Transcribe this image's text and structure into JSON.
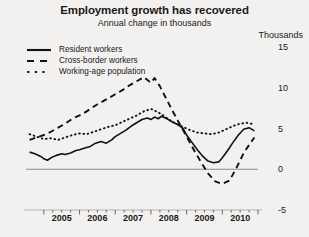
{
  "chart_data": {
    "type": "line",
    "title": "Employment growth has recovered",
    "subtitle": "Annual change in thousands",
    "unit_label": "Thousands",
    "xlabel": "",
    "ylabel": "Thousands",
    "ylim": [
      -5,
      15
    ],
    "yticks": [
      15,
      10,
      5,
      0,
      -5
    ],
    "ytick_labels": [
      "15",
      "10",
      "5",
      "0",
      "-5"
    ],
    "xlim": [
      2004.5,
      2011.0
    ],
    "xticks": [
      2005,
      2006,
      2007,
      2008,
      2009,
      2010
    ],
    "xtick_labels": [
      "2005",
      "2006",
      "2007",
      "2008",
      "2009",
      "2010"
    ],
    "minor_ticks_per_year": 4,
    "grid": false,
    "zero_line": true,
    "legend_position": "top-left",
    "series": [
      {
        "name": "Resident workers",
        "style": "solid",
        "color": "#111111",
        "x": [
          2004.6,
          2004.75,
          2004.9,
          2005.0,
          2005.1,
          2005.2,
          2005.35,
          2005.5,
          2005.6,
          2005.75,
          2005.9,
          2006.0,
          2006.15,
          2006.3,
          2006.45,
          2006.6,
          2006.75,
          2006.9,
          2007.0,
          2007.15,
          2007.3,
          2007.45,
          2007.6,
          2007.75,
          2007.9,
          2008.0,
          2008.1,
          2008.2,
          2008.3,
          2008.45,
          2008.6,
          2008.75,
          2008.9,
          2009.0,
          2009.15,
          2009.3,
          2009.45,
          2009.6,
          2009.75,
          2009.9,
          2010.0,
          2010.15,
          2010.3,
          2010.45,
          2010.6,
          2010.75,
          2010.9
        ],
        "y": [
          2.1,
          1.9,
          1.6,
          1.3,
          1.1,
          1.4,
          1.7,
          1.9,
          1.8,
          2.0,
          2.3,
          2.4,
          2.6,
          2.8,
          3.2,
          3.4,
          3.2,
          3.6,
          4.0,
          4.4,
          4.8,
          5.3,
          5.7,
          6.1,
          6.3,
          6.1,
          6.4,
          6.2,
          6.5,
          6.2,
          5.8,
          5.5,
          5.0,
          4.2,
          3.3,
          2.4,
          1.6,
          1.0,
          0.8,
          0.9,
          1.4,
          2.3,
          3.3,
          4.2,
          4.9,
          5.1,
          4.7
        ]
      },
      {
        "name": "Cross-border workers",
        "style": "dashed",
        "color": "#111111",
        "x": [
          2004.6,
          2004.8,
          2005.0,
          2005.2,
          2005.4,
          2005.6,
          2005.8,
          2006.0,
          2006.2,
          2006.4,
          2006.6,
          2006.8,
          2007.0,
          2007.2,
          2007.4,
          2007.6,
          2007.8,
          2008.0,
          2008.1,
          2008.25,
          2008.4,
          2008.6,
          2008.8,
          2009.0,
          2009.2,
          2009.4,
          2009.6,
          2009.8,
          2010.0,
          2010.2,
          2010.4,
          2010.6,
          2010.8,
          2010.9
        ],
        "y": [
          3.6,
          3.9,
          4.2,
          4.6,
          5.1,
          5.6,
          6.2,
          6.6,
          7.1,
          7.7,
          8.2,
          8.7,
          9.2,
          9.7,
          10.3,
          10.8,
          11.3,
          10.6,
          11.2,
          10.2,
          8.9,
          7.2,
          5.6,
          4.0,
          2.4,
          0.9,
          -0.5,
          -1.5,
          -1.8,
          -1.4,
          0.2,
          2.0,
          3.3,
          3.9
        ]
      },
      {
        "name": "Working-age population",
        "style": "dotted",
        "color": "#111111",
        "x": [
          2004.6,
          2004.8,
          2005.0,
          2005.2,
          2005.4,
          2005.6,
          2005.8,
          2006.0,
          2006.2,
          2006.4,
          2006.6,
          2006.8,
          2007.0,
          2007.2,
          2007.4,
          2007.6,
          2007.8,
          2008.0,
          2008.2,
          2008.35,
          2008.5,
          2008.7,
          2008.9,
          2009.1,
          2009.3,
          2009.5,
          2009.7,
          2009.9,
          2010.1,
          2010.3,
          2010.5,
          2010.7,
          2010.9
        ],
        "y": [
          4.3,
          4.0,
          3.7,
          3.8,
          3.6,
          3.9,
          4.2,
          4.4,
          4.3,
          4.6,
          4.9,
          5.2,
          5.4,
          5.8,
          6.2,
          6.6,
          7.1,
          7.4,
          7.0,
          6.6,
          6.1,
          5.6,
          5.2,
          4.8,
          4.5,
          4.4,
          4.3,
          4.5,
          4.9,
          5.3,
          5.6,
          5.7,
          5.5
        ]
      }
    ]
  }
}
